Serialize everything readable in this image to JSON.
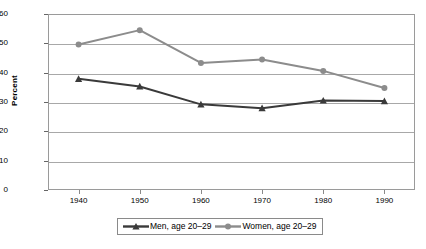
{
  "chart_data": {
    "type": "line",
    "title": "",
    "xlabel": "",
    "ylabel": "Percent",
    "categories": [
      "1940",
      "1950",
      "1960",
      "1970",
      "1980",
      "1990"
    ],
    "ylim": [
      0,
      60
    ],
    "yticks": [
      "0",
      "10",
      "20",
      "30",
      "40",
      "50",
      "60"
    ],
    "grid": true,
    "legend_position": "bottom",
    "series": [
      {
        "name": "Men, age 20–29",
        "color": "#3a3a3a",
        "marker": "triangle",
        "values": [
          37.9,
          35.3,
          29.2,
          27.9,
          30.5,
          30.3
        ]
      },
      {
        "name": "Women, age 20–29",
        "color": "#8c8c8c",
        "marker": "circle",
        "values": [
          49.6,
          54.5,
          43.3,
          44.5,
          40.6,
          34.8
        ]
      }
    ]
  },
  "axes": {
    "y_title": "Percent"
  },
  "legend": {
    "items": [
      {
        "label": "Men, age 20–29"
      },
      {
        "label": "Women, age 20–29"
      }
    ]
  },
  "colors": {
    "men": "#3a3a3a",
    "women": "#8c8c8c",
    "grid": "#a8a8a8",
    "frame": "#9a9a9a",
    "text": "#000000",
    "background": "#ffffff"
  }
}
